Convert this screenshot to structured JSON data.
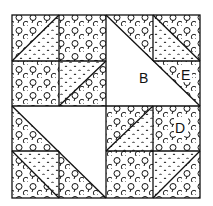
{
  "diagram": {
    "type": "quilt-block-pattern",
    "grid": {
      "rows": 4,
      "cols": 4
    },
    "colors": {
      "line": "#111111",
      "background": "#ffffff"
    },
    "fabrics": {
      "floral": "circle-print-icon",
      "dots": "dot-print-icon",
      "plain": "blank"
    },
    "labels": [
      {
        "id": "B",
        "text": "B"
      },
      {
        "id": "E",
        "text": "E"
      },
      {
        "id": "D",
        "text": "D"
      }
    ]
  }
}
